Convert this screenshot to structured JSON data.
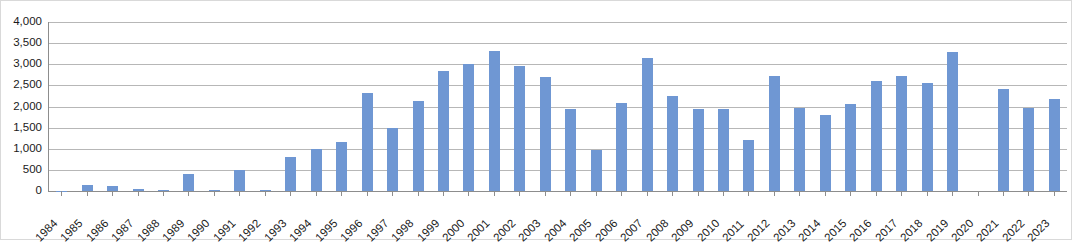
{
  "chart_data": {
    "type": "bar",
    "title": "",
    "subtitle": "",
    "xlabel": "",
    "ylabel": "",
    "ylim": [
      0,
      4000
    ],
    "y_ticks": [
      0,
      500,
      1000,
      1500,
      2000,
      2500,
      3000,
      3500,
      4000
    ],
    "y_tick_labels": [
      "0",
      "500",
      "1,000",
      "1,500",
      "2,000",
      "2,500",
      "3,000",
      "3,500",
      "4,000"
    ],
    "grid": true,
    "legend": "none",
    "series_color": "#6F97D3",
    "gridline_color": "#B7B7B7",
    "axis_color": "#8D8D8D",
    "categories": [
      "1984",
      "1985",
      "1986",
      "1987",
      "1988",
      "1989",
      "1990",
      "1991",
      "1992",
      "1993",
      "1994",
      "1995",
      "1996",
      "1997",
      "1998",
      "1999",
      "2000",
      "2001",
      "2002",
      "2003",
      "2004",
      "2005",
      "2006",
      "2007",
      "2008",
      "2009",
      "2010",
      "2011",
      "2012",
      "2013",
      "2014",
      "2015",
      "2016",
      "2017",
      "2018",
      "2019",
      "2020",
      "2021",
      "2022",
      "2023"
    ],
    "values": [
      10,
      150,
      130,
      40,
      20,
      400,
      20,
      500,
      20,
      810,
      1000,
      1150,
      2330,
      1490,
      2120,
      2850,
      3010,
      3320,
      2950,
      2700,
      1950,
      970,
      2080,
      3150,
      2250,
      1950,
      1950,
      1200,
      2720,
      1970,
      1790,
      2050,
      2600,
      2730,
      2560,
      3280,
      0,
      2420,
      1960,
      2180
    ]
  }
}
